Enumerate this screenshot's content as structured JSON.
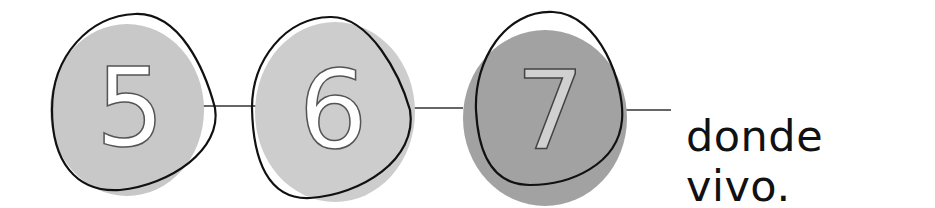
{
  "steps": [
    {
      "label": "5",
      "fill": "#c8c8c8"
    },
    {
      "label": "6",
      "fill": "#cdcdcd"
    },
    {
      "label": "7",
      "fill": "#a2a2a2"
    }
  ],
  "caption": "donde vivo.",
  "colors": {
    "outline": "#111111",
    "connector": "#333333",
    "digit_stroke": "#555555"
  }
}
